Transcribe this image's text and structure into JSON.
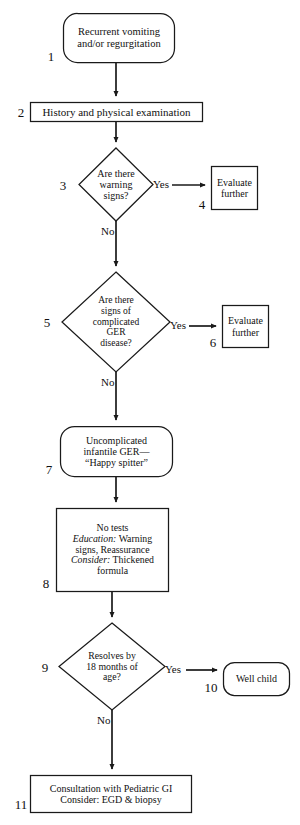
{
  "diagram": {
    "colors": {
      "stroke": "#1a1a1a",
      "text": "#111111",
      "background": "#ffffff"
    },
    "nodes": [
      {
        "id": "1",
        "number": "1",
        "shape": "rounded-rect",
        "lines": [
          "Recurrent vomiting",
          "and/or regurgitation"
        ],
        "text": "Recurrent vomiting and/or regurgitation"
      },
      {
        "id": "2",
        "number": "2",
        "shape": "rect",
        "lines": [
          "History and physical examination"
        ],
        "text": "History and physical examination"
      },
      {
        "id": "3",
        "number": "3",
        "shape": "diamond",
        "lines": [
          "Are there",
          "warning",
          "signs?"
        ],
        "text": "Are there warning signs?"
      },
      {
        "id": "4",
        "number": "4",
        "shape": "rect",
        "lines": [
          "Evaluate",
          "further"
        ],
        "text": "Evaluate further"
      },
      {
        "id": "5",
        "number": "5",
        "shape": "diamond",
        "lines": [
          "Are there",
          "signs of",
          "complicated",
          "GER",
          "disease?"
        ],
        "text": "Are there signs of complicated GER disease?"
      },
      {
        "id": "6",
        "number": "6",
        "shape": "rect",
        "lines": [
          "Evaluate",
          "further"
        ],
        "text": "Evaluate further"
      },
      {
        "id": "7",
        "number": "7",
        "shape": "rounded-rect",
        "lines": [
          "Uncomplicated",
          "infantile GER—",
          "“Happy spitter”"
        ],
        "text": "Uncomplicated infantile GER—“Happy spitter”"
      },
      {
        "id": "8",
        "number": "8",
        "shape": "rect",
        "lines": [
          "No tests",
          "Education: Warning",
          "signs, Reassurance",
          "Consider: Thickened",
          "formula"
        ],
        "text": "No tests Education: Warning signs, Reassurance Consider: Thickened formula",
        "italic_labels": [
          "Education:",
          "Consider:"
        ]
      },
      {
        "id": "9",
        "number": "9",
        "shape": "diamond",
        "lines": [
          "Resolves by",
          "18 months of",
          "age?"
        ],
        "text": "Resolves by 18 months of age?"
      },
      {
        "id": "10",
        "number": "10",
        "shape": "rounded-rect",
        "lines": [
          "Well child"
        ],
        "text": "Well child"
      },
      {
        "id": "11",
        "number": "11",
        "shape": "rect",
        "lines": [
          "Consultation with Pediatric GI",
          "Consider: EGD & biopsy"
        ],
        "text": "Consultation with Pediatric GI Consider: EGD & biopsy"
      }
    ],
    "edge_labels": {
      "yes_3": "Yes",
      "no_3": "No",
      "yes_5": "Yes",
      "no_5": "No",
      "yes_9": "Yes",
      "no_9": "No"
    }
  }
}
